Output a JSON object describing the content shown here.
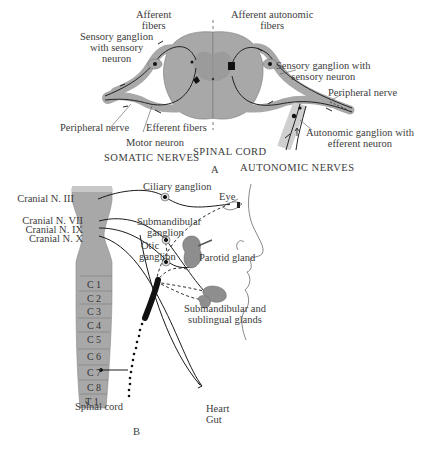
{
  "figure": {
    "panel_a": {
      "panel_label": "A",
      "section_titles": {
        "left": "SOMATIC NERVES",
        "center": "SPINAL CORD",
        "right": "AUTONOMIC NERVES"
      },
      "labels": {
        "afferent_fibers_line1": "Afferent",
        "afferent_fibers_line2": "fibers",
        "sensory_ganglion_left_line1": "Sensory ganglion",
        "sensory_ganglion_left_line2": "with sensory",
        "sensory_ganglion_left_line3": "neuron",
        "peripheral_nerve_left": "Peripheral nerve",
        "efferent_fibers": "Efferent fibers",
        "motor_neuron": "Motor neuron",
        "afferent_autonomic_line1": "Afferent autonomic",
        "afferent_autonomic_line2": "fibers",
        "sensory_ganglion_right_line1": "Sensory ganglion with",
        "sensory_ganglion_right_line2": "sensory neuron",
        "peripheral_nerve_right": "Peripheral nerve",
        "autonomic_ganglion_line1": "Autonomic ganglion with",
        "autonomic_ganglion_line2": "efferent neuron"
      }
    },
    "panel_b": {
      "panel_label": "B",
      "cranial_nerves": [
        "Cranial N. III",
        "Cranial N. VII",
        "Cranial N. IX",
        "Cranial N. X"
      ],
      "segments": [
        "C 1",
        "C 2",
        "C 3",
        "C 4",
        "C 5",
        "C 6",
        "C 7",
        "C 8",
        "T 1"
      ],
      "labels": {
        "ciliary_ganglion": "Ciliary ganglion",
        "eye": "Eye",
        "submandibular_ganglion_line1": "Submandibular",
        "submandibular_ganglion_line2": "ganglion",
        "otic_ganglion_line1": "Otic",
        "otic_ganglion_line2": "ganglion",
        "parotid_gland": "Parotid gland",
        "salivary_glands_line1": "Submandibular and",
        "salivary_glands_line2": "sublingual glands",
        "spinal_cord": "Spinal cord",
        "heart": "Heart",
        "gut": "Gut"
      }
    },
    "colors": {
      "tissue_gray": "#a8a8a8",
      "dark_gray": "#8e8e8e",
      "line": "#1a1a1a",
      "text": "#3c3c3c",
      "background": "#ffffff"
    }
  }
}
